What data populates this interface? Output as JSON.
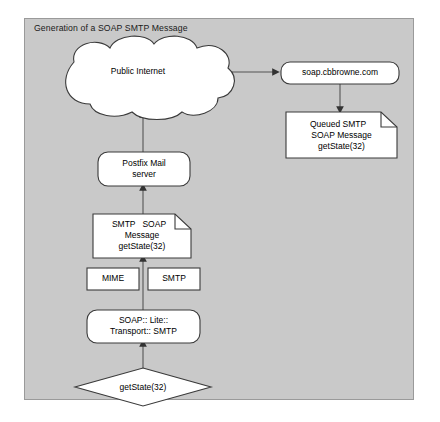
{
  "diagram": {
    "title": "Generation of a SOAP SMTP Message",
    "panel_bg": "#c9c9c9",
    "node_fill": "#ffffff",
    "stroke": "#333333",
    "nodes": {
      "cloud": {
        "label": "Public Internet",
        "shape": "cloud"
      },
      "remote_host": {
        "label": "soap.cbbrowne.com",
        "shape": "rounded-rect"
      },
      "queued_message": {
        "line1": "Queued SMTP",
        "line2": "SOAP Message",
        "line3": "getState(32)",
        "shape": "note"
      },
      "postfix": {
        "line1": "Postfix Mail",
        "line2": "server",
        "shape": "rounded-rect"
      },
      "smtp_soap_message": {
        "line1": "SMTP   SOAP",
        "line2": "Message",
        "line3": "getState(32)",
        "shape": "note"
      },
      "mime": {
        "label": "MIME",
        "shape": "rect"
      },
      "smtp": {
        "label": "SMTP",
        "shape": "rect"
      },
      "soap_lite": {
        "line1": "SOAP:: Lite::",
        "line2": "Transport:: SMTP",
        "shape": "rounded-rect"
      },
      "call": {
        "label": "getState(32)",
        "shape": "diamond"
      }
    },
    "edges": [
      {
        "name": "cloud-to-remote-host",
        "from": "cloud",
        "to": "remote_host",
        "direction": "right"
      },
      {
        "name": "remote-host-to-queued-message",
        "from": "remote_host",
        "to": "queued_message",
        "direction": "down"
      },
      {
        "name": "postfix-to-cloud",
        "from": "postfix",
        "to": "cloud",
        "direction": "up"
      },
      {
        "name": "smtp-soap-message-to-postfix",
        "from": "smtp_soap_message",
        "to": "postfix",
        "direction": "up"
      },
      {
        "name": "soap-lite-to-smtp-soap-message",
        "from": "soap_lite",
        "to": "smtp_soap_message",
        "direction": "up"
      },
      {
        "name": "call-to-soap-lite",
        "from": "call",
        "to": "soap_lite",
        "direction": "up"
      }
    ]
  }
}
